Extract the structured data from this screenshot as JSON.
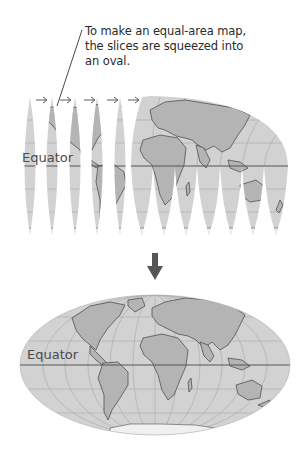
{
  "callout": {
    "lines": [
      "To make an equal-area map,",
      "the slices are squeezed into",
      "an oval."
    ]
  },
  "top_map": {
    "label": "Equator",
    "gore_count": 12,
    "arrow_symbol": "→",
    "arrow_count": 5
  },
  "transition_arrow": {
    "direction": "down"
  },
  "bottom_map": {
    "label": "Equator",
    "projection": "oval equal-area"
  },
  "colors": {
    "ocean": "#d2d2d2",
    "land": "#b4b4b4",
    "coastline": "#505050",
    "graticule": "#a8a8a8",
    "equator_line": "#555555",
    "arrow": "#555555",
    "text": "#2a2a2a"
  }
}
